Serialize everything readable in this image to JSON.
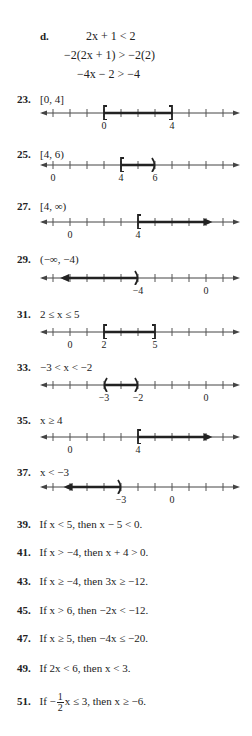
{
  "part_d": {
    "label": "d.",
    "lines": [
      "2x + 1 < 2",
      "−2(2x + 1) > −2(2)",
      "−4x − 2 > −4"
    ]
  },
  "problems": [
    {
      "number": "23.",
      "expr": "[0, 4]"
    },
    {
      "number": "25.",
      "expr": "[4, 6)"
    },
    {
      "number": "27.",
      "expr": "[4, ∞)"
    },
    {
      "number": "29.",
      "expr": "(−∞, −4)"
    },
    {
      "number": "31.",
      "expr": "2 ≤ x ≤ 5"
    },
    {
      "number": "33.",
      "expr": "−3 < x < −2"
    },
    {
      "number": "35.",
      "expr": "x ≥ 4"
    },
    {
      "number": "37.",
      "expr": "x < −3"
    }
  ],
  "number_lines": [
    {
      "labels": [
        {
          "tick": 3,
          "text": "0"
        },
        {
          "tick": 7,
          "text": "4"
        }
      ],
      "left": {
        "tick": 3,
        "type": "["
      },
      "right": {
        "tick": 7,
        "type": "]"
      }
    },
    {
      "labels": [
        {
          "tick": 0,
          "text": "0"
        },
        {
          "tick": 4,
          "text": "4"
        },
        {
          "tick": 6,
          "text": "6"
        }
      ],
      "left": {
        "tick": 4,
        "type": "["
      },
      "right": {
        "tick": 6,
        "type": ")"
      }
    },
    {
      "labels": [
        {
          "tick": 1,
          "text": "0"
        },
        {
          "tick": 5,
          "text": "4"
        }
      ],
      "left": {
        "tick": 5,
        "type": "["
      },
      "right": {
        "tick": 9.2,
        "type": "arrow"
      }
    },
    {
      "labels": [
        {
          "tick": 5,
          "text": "−4"
        },
        {
          "tick": 9,
          "text": "0"
        }
      ],
      "left": {
        "tick": 0.6,
        "type": "arrow"
      },
      "right": {
        "tick": 5,
        "type": ")"
      }
    },
    {
      "labels": [
        {
          "tick": 1,
          "text": "0"
        },
        {
          "tick": 3,
          "text": "2"
        },
        {
          "tick": 6,
          "text": "5"
        }
      ],
      "left": {
        "tick": 3,
        "type": "["
      },
      "right": {
        "tick": 6,
        "type": "]"
      }
    },
    {
      "labels": [
        {
          "tick": 3,
          "text": "−3"
        },
        {
          "tick": 5,
          "text": "−2"
        },
        {
          "tick": 9,
          "text": "0"
        }
      ],
      "left": {
        "tick": 3,
        "type": "("
      },
      "right": {
        "tick": 5,
        "type": ")"
      }
    },
    {
      "labels": [
        {
          "tick": 1,
          "text": "0"
        },
        {
          "tick": 5,
          "text": "4"
        }
      ],
      "left": {
        "tick": 5,
        "type": "["
      },
      "right": {
        "tick": 9.2,
        "type": "arrow"
      }
    },
    {
      "labels": [
        {
          "tick": 4,
          "text": "−3"
        },
        {
          "tick": 7,
          "text": "0"
        }
      ],
      "left": {
        "tick": 0.8,
        "type": "arrow"
      },
      "right": {
        "tick": 4,
        "type": ")"
      }
    }
  ],
  "statements": [
    {
      "number": "39.",
      "text": "If x < 5, then x − 5 < 0."
    },
    {
      "number": "41.",
      "text": "If x > −4, then x + 4 > 0."
    },
    {
      "number": "43.",
      "text": "If x ≥ −4, then 3x ≥ −12."
    },
    {
      "number": "45.",
      "text": "If x > 6, then −2x < −12."
    },
    {
      "number": "47.",
      "text": "If x ≥ 5, then −4x ≤ −20."
    },
    {
      "number": "49.",
      "text": "If 2x < 6, then x < 3."
    },
    {
      "number": "51.",
      "prefix": "If −",
      "frac_num": "1",
      "frac_den": "2",
      "suffix": "x ≤ 3, then x ≥ −6."
    }
  ]
}
